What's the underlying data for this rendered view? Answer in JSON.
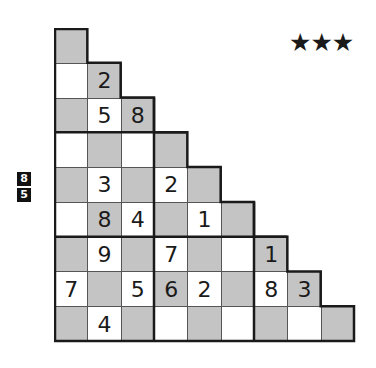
{
  "puzzle": {
    "difficulty_stars": "★★★",
    "side_clues": [
      "8",
      "5"
    ],
    "grid_size": 9,
    "rows": [
      [
        {
          "v": "",
          "c": "g"
        }
      ],
      [
        {
          "v": "",
          "c": "w"
        },
        {
          "v": "2",
          "c": "g"
        }
      ],
      [
        {
          "v": "",
          "c": "g"
        },
        {
          "v": "5",
          "c": "w"
        },
        {
          "v": "8",
          "c": "g"
        }
      ],
      [
        {
          "v": "",
          "c": "w"
        },
        {
          "v": "",
          "c": "g"
        },
        {
          "v": "",
          "c": "w"
        },
        {
          "v": "",
          "c": "g"
        }
      ],
      [
        {
          "v": "",
          "c": "g"
        },
        {
          "v": "3",
          "c": "w"
        },
        {
          "v": "",
          "c": "g"
        },
        {
          "v": "2",
          "c": "w"
        },
        {
          "v": "",
          "c": "g"
        }
      ],
      [
        {
          "v": "",
          "c": "w"
        },
        {
          "v": "8",
          "c": "g"
        },
        {
          "v": "4",
          "c": "w"
        },
        {
          "v": "",
          "c": "g"
        },
        {
          "v": "1",
          "c": "w"
        },
        {
          "v": "",
          "c": "g"
        }
      ],
      [
        {
          "v": "",
          "c": "g"
        },
        {
          "v": "9",
          "c": "w"
        },
        {
          "v": "",
          "c": "g"
        },
        {
          "v": "7",
          "c": "w"
        },
        {
          "v": "",
          "c": "g"
        },
        {
          "v": "",
          "c": "w"
        },
        {
          "v": "1",
          "c": "g"
        }
      ],
      [
        {
          "v": "7",
          "c": "w"
        },
        {
          "v": "",
          "c": "g"
        },
        {
          "v": "5",
          "c": "w"
        },
        {
          "v": "6",
          "c": "g"
        },
        {
          "v": "2",
          "c": "w"
        },
        {
          "v": "",
          "c": "g"
        },
        {
          "v": "8",
          "c": "w"
        },
        {
          "v": "3",
          "c": "g"
        }
      ],
      [
        {
          "v": "",
          "c": "g"
        },
        {
          "v": "4",
          "c": "w"
        },
        {
          "v": "",
          "c": "g"
        },
        {
          "v": "",
          "c": "w"
        },
        {
          "v": "",
          "c": "g"
        },
        {
          "v": "",
          "c": "w"
        },
        {
          "v": "",
          "c": "g"
        },
        {
          "v": "",
          "c": "w"
        },
        {
          "v": "",
          "c": "g"
        }
      ]
    ]
  },
  "colors": {
    "gray_cell": "#c4c4c4",
    "white_cell": "#ffffff",
    "grid_line": "#555555",
    "thick_line": "#1a1a1a",
    "clue_bg": "#111111"
  }
}
